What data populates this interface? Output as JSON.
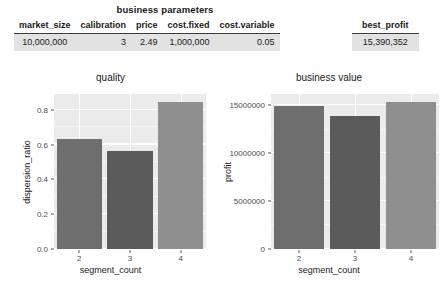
{
  "table": {
    "title": "business parameters",
    "columns": [
      "market_size",
      "calibration",
      "price",
      "cost.fixed",
      "cost.variable"
    ],
    "row": [
      "10,000,000",
      "3",
      "2.49",
      "1,000,000",
      "0.05"
    ],
    "best": {
      "column": "best_profit",
      "value": "15,390,352"
    }
  },
  "chart_data": [
    {
      "type": "bar",
      "title": "quality",
      "xlabel": "segment_count",
      "ylabel": "dispersion_ratio",
      "categories": [
        "2",
        "3",
        "4"
      ],
      "values": [
        0.63,
        0.565,
        0.845
      ],
      "yticks": [
        "0.0",
        "0.2",
        "0.4",
        "0.6",
        "0.8"
      ],
      "ytick_values": [
        0.0,
        0.2,
        0.4,
        0.6,
        0.8
      ],
      "ylim": [
        0,
        0.89
      ],
      "bar_colors": [
        "#6e6e6e",
        "#5b5b5b",
        "#8f8f8f"
      ],
      "panel_color": "#ebebeb",
      "grid": true,
      "legend": "none"
    },
    {
      "type": "bar",
      "title": "business value",
      "xlabel": "segment_count",
      "ylabel": "profit",
      "categories": [
        "2",
        "3",
        "4"
      ],
      "values": [
        14950000,
        13900000,
        15390352
      ],
      "yticks": [
        "0",
        "5000000",
        "10000000",
        "15000000"
      ],
      "ytick_values": [
        0,
        5000000,
        10000000,
        15000000
      ],
      "ylim": [
        0,
        16200000
      ],
      "bar_colors": [
        "#6e6e6e",
        "#5b5b5b",
        "#8f8f8f"
      ],
      "panel_color": "#ebebeb",
      "grid": true,
      "legend": "none"
    }
  ]
}
